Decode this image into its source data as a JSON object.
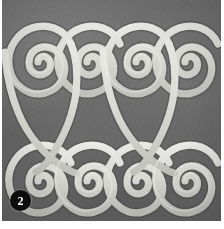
{
  "figure": {
    "kind": "photographic-plate",
    "badge_number": "2",
    "colors": {
      "plate_background": "#6e6e6e",
      "motif_line": "#d8d8d8",
      "motif_line_highlight": "#e9e9e9",
      "motif_line_shadow": "#9a9a9a",
      "badge_background": "#0d0d0d",
      "badge_text": "#ffffff",
      "paper": "#ffffff"
    }
  },
  "motif": {
    "name": "double-spiral-meander-band",
    "top_row_spiral_count": 4,
    "bottom_row_spiral_count": 4,
    "spiral_turns": 2.5,
    "line_width": 7,
    "top_row_centers": [
      {
        "cx": 36,
        "cy": 62
      },
      {
        "cx": 85,
        "cy": 62
      },
      {
        "cx": 134,
        "cy": 62
      },
      {
        "cx": 183,
        "cy": 62
      }
    ],
    "bottom_row_centers": [
      {
        "cx": 36,
        "cy": 181
      },
      {
        "cx": 85,
        "cy": 181
      },
      {
        "cx": 134,
        "cy": 181
      },
      {
        "cx": 183,
        "cy": 181
      }
    ],
    "connectors": [
      {
        "from": "top-1",
        "to": "bottom-2"
      },
      {
        "from": "top-2",
        "to": "bottom-1"
      },
      {
        "from": "top-3",
        "to": "bottom-4"
      },
      {
        "from": "top-4",
        "to": "bottom-3"
      }
    ]
  }
}
